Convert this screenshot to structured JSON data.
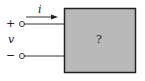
{
  "diagram": {
    "current_label": "i",
    "plus_label": "+",
    "voltage_label": "v",
    "minus_label": "−",
    "box_label": "?",
    "box_fill": "#b9b9b9",
    "line_color": "#222222"
  }
}
